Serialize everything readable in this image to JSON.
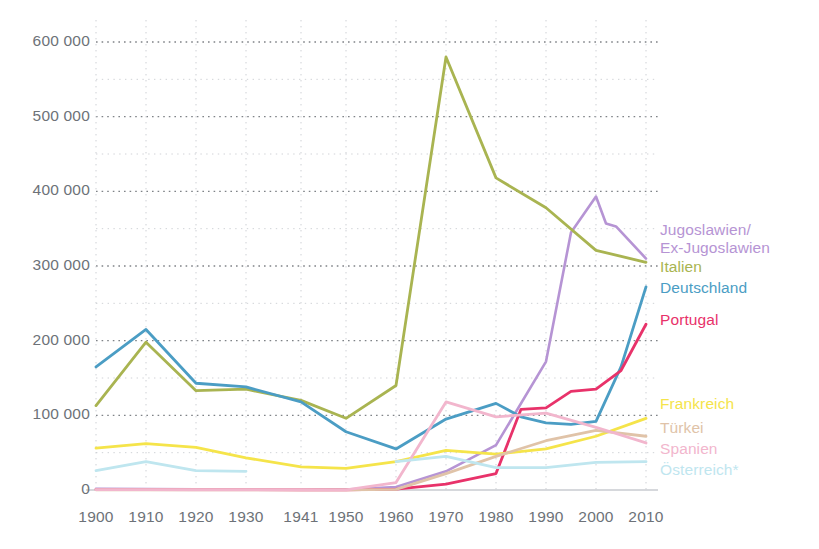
{
  "chart_data": {
    "type": "line",
    "title": "",
    "subtitle": "",
    "xlabel": "",
    "ylabel": "",
    "x": [
      "1900",
      "1910",
      "1920",
      "1930",
      "1941",
      "1950",
      "1960",
      "1970",
      "1980",
      "1990",
      "2000",
      "2010"
    ],
    "xlim": [
      1900,
      2010
    ],
    "ylim": [
      0,
      620000
    ],
    "yticks": [
      0,
      100000,
      200000,
      300000,
      400000,
      500000,
      600000
    ],
    "ytick_labels": [
      "0",
      "100 000",
      "200 000",
      "300 000",
      "400 000",
      "500 000",
      "600 000"
    ],
    "minor_yticks": [
      50000,
      150000,
      250000,
      350000,
      450000,
      550000
    ],
    "grid": true,
    "grid_style": "dotted",
    "legend_position": "right-inline",
    "series": [
      {
        "name": "Jugoslawien/\nEx-Jugoslawien",
        "label_lines": [
          "Jugoslawien/",
          "Ex-Jugoslawien"
        ],
        "color": "#b694d4",
        "width": 2.6,
        "values": [
          1500,
          1200,
          1000,
          900,
          800,
          700,
          4000,
          25000,
          60000,
          172000,
          393000,
          310000
        ],
        "extra_points": [
          {
            "x": 1995,
            "y": 345000
          },
          {
            "x": 2002,
            "y": 357000
          },
          {
            "x": 2004,
            "y": 353000
          }
        ]
      },
      {
        "name": "Italien",
        "label_lines": [
          "Italien"
        ],
        "color": "#a9b451",
        "width": 2.8,
        "values": [
          113000,
          198000,
          133000,
          135000,
          120000,
          96000,
          140000,
          580000,
          418000,
          378000,
          321000,
          305000
        ]
      },
      {
        "name": "Deutschland",
        "label_lines": [
          "Deutschland"
        ],
        "color": "#4b9dc4",
        "width": 2.8,
        "values": [
          165000,
          215000,
          143000,
          138000,
          118000,
          78000,
          55000,
          95000,
          116000,
          90000,
          92000,
          272000
        ],
        "extra_points": [
          {
            "x": 1985,
            "y": 98000
          },
          {
            "x": 1995,
            "y": 88000
          },
          {
            "x": 2005,
            "y": 165000
          }
        ]
      },
      {
        "name": "Portugal",
        "label_lines": [
          "Portugal"
        ],
        "color": "#e8326a",
        "width": 2.8,
        "values": [
          600,
          500,
          450,
          400,
          350,
          300,
          1200,
          8000,
          22000,
          110000,
          135000,
          222000
        ],
        "extra_points": [
          {
            "x": 1985,
            "y": 108000
          },
          {
            "x": 1995,
            "y": 132000
          },
          {
            "x": 2005,
            "y": 160000
          }
        ]
      },
      {
        "name": "Frankreich",
        "label_lines": [
          "Frankreich"
        ],
        "color": "#f5e44a",
        "width": 2.8,
        "values": [
          56000,
          62000,
          57000,
          43000,
          31000,
          29000,
          38000,
          53000,
          48000,
          55000,
          72000,
          96000
        ]
      },
      {
        "name": "Türkei",
        "label_lines": [
          "Türkei"
        ],
        "color": "#e0c3a8",
        "width": 2.8,
        "values": [
          300,
          280,
          260,
          240,
          220,
          200,
          900,
          22000,
          45000,
          66000,
          80000,
          72000
        ]
      },
      {
        "name": "Spanien",
        "label_lines": [
          "Spanien"
        ],
        "color": "#f2b6cd",
        "width": 2.8,
        "values": [
          400,
          380,
          360,
          340,
          320,
          300,
          10000,
          118000,
          98000,
          103000,
          84000,
          63000
        ]
      },
      {
        "name": "Österreich*",
        "label_lines": [
          "Österreich*"
        ],
        "color": "#bfe6ef",
        "width": 2.8,
        "values": [
          26000,
          38000,
          26000,
          25000,
          null,
          null,
          38000,
          45000,
          30000,
          30000,
          37000,
          38000
        ]
      }
    ]
  },
  "axes": {
    "y_labels": [
      "600 000",
      "500 000",
      "400 000",
      "300 000",
      "200 000",
      "100 000",
      "0"
    ],
    "x_labels": [
      "1900",
      "1910",
      "1920",
      "1930",
      "1941",
      "1950",
      "1960",
      "1970",
      "1980",
      "1990",
      "2000",
      "2010"
    ]
  },
  "legend": {
    "entries": [
      {
        "line1": "Jugoslawien/",
        "line2": "Ex-Jugoslawien",
        "color": "#b694d4"
      },
      {
        "line1": "Italien",
        "line2": "",
        "color": "#a9b451"
      },
      {
        "line1": "Deutschland",
        "line2": "",
        "color": "#4b9dc4"
      },
      {
        "line1": "Portugal",
        "line2": "",
        "color": "#e8326a"
      },
      {
        "line1": "Frankreich",
        "line2": "",
        "color": "#f5e44a"
      },
      {
        "line1": "Türkei",
        "line2": "",
        "color": "#e0c3a8"
      },
      {
        "line1": "Spanien",
        "line2": "",
        "color": "#f2b6cd"
      },
      {
        "line1": "Österreich*",
        "line2": "",
        "color": "#bfe6ef"
      }
    ]
  },
  "colors": {
    "axis_text": "#6d7278",
    "grid_major": "#555a60",
    "grid_minor": "#c9ccd1",
    "baseline": "#c8cbd0",
    "background": "#ffffff"
  }
}
